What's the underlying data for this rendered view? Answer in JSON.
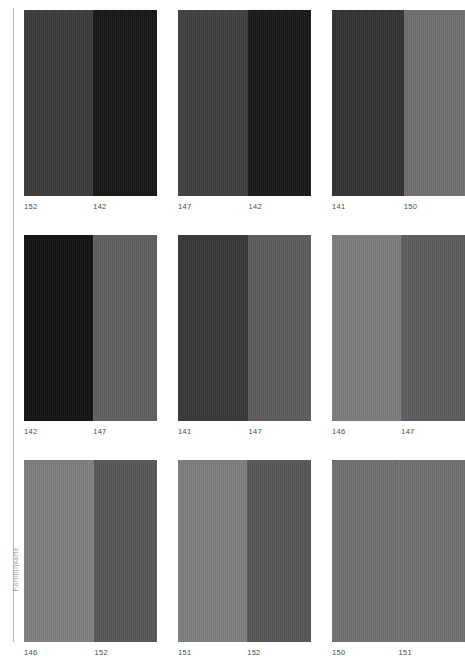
{
  "plate": {
    "margin_note": "Farbtonkarte",
    "label_color": "#4b4b4b",
    "rule_color": "#b9b9b9",
    "background": "#ffffff"
  },
  "chart_data": {
    "type": "table",
    "title": "",
    "xlabel": "",
    "ylabel": "",
    "columns": [
      "left_sample",
      "right_sample"
    ],
    "rows": [
      {
        "left_label": "152",
        "left_color": "#3b3b3b",
        "right_label": "142",
        "right_color": "#171717"
      },
      {
        "left_label": "147",
        "left_color": "#404040",
        "right_label": "142",
        "right_color": "#181818"
      },
      {
        "left_label": "141",
        "left_color": "#323232",
        "right_label": "150",
        "right_color": "#6e6e6e"
      },
      {
        "left_label": "142",
        "left_color": "#131313",
        "right_label": "147",
        "right_color": "#5e5e5e"
      },
      {
        "left_label": "141",
        "left_color": "#383838",
        "right_label": "147",
        "right_color": "#5c5c5c"
      },
      {
        "left_label": "146",
        "left_color": "#7b7b7b",
        "right_label": "147",
        "right_color": "#5d5d5d"
      },
      {
        "left_label": "146",
        "left_color": "#7e7e7e",
        "right_label": "152",
        "right_color": "#575757"
      },
      {
        "left_label": "151",
        "left_color": "#7d7d7d",
        "right_label": "152",
        "right_color": "#565656"
      },
      {
        "left_label": "150",
        "left_color": "#6f6f6f",
        "right_label": "151",
        "right_color": "#707070"
      }
    ],
    "split_ratios": [
      0.52,
      0.53,
      0.54,
      0.52,
      0.53,
      0.52,
      0.53,
      0.52,
      0.5
    ],
    "grid": {
      "columns": 3,
      "rows": 3
    },
    "legend": "none",
    "values": [
      152,
      142,
      147,
      142,
      141,
      150,
      142,
      147,
      141,
      147,
      146,
      147,
      146,
      152,
      151,
      152,
      150,
      151
    ]
  }
}
